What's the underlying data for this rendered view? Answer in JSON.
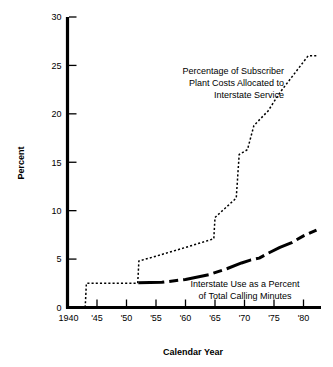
{
  "chart_data": {
    "type": "line",
    "title": "",
    "xlabel": "Calendar Year",
    "ylabel": "Percent",
    "xlim": [
      1940,
      1982.5
    ],
    "ylim": [
      0,
      30
    ],
    "grid": false,
    "legend_position": "inline-annotations",
    "x_tick_labels": [
      "1940",
      "'45",
      "'50",
      "'55",
      "'60",
      "'65",
      "'70",
      "'75",
      "'80"
    ],
    "x_tick_values": [
      1940,
      1945,
      1950,
      1955,
      1960,
      1965,
      1970,
      1975,
      1980
    ],
    "y_tick_labels": [
      "0",
      "5",
      "10",
      "15",
      "20",
      "25",
      "30"
    ],
    "y_tick_values": [
      0,
      5,
      10,
      15,
      20,
      25,
      30
    ],
    "series": [
      {
        "name": "Percentage of Subscriber Plant Costs Allocated to Interstate Service",
        "style": "dotted",
        "color": "#000000",
        "points": [
          [
            1943.0,
            0.0
          ],
          [
            1943.2,
            2.5
          ],
          [
            1951.9,
            2.5
          ],
          [
            1952.1,
            4.8
          ],
          [
            1955.0,
            5.3
          ],
          [
            1960.0,
            6.2
          ],
          [
            1964.8,
            7.1
          ],
          [
            1965.0,
            9.3
          ],
          [
            1968.6,
            11.3
          ],
          [
            1969.1,
            15.8
          ],
          [
            1970.5,
            16.3
          ],
          [
            1971.6,
            18.8
          ],
          [
            1974.0,
            20.3
          ],
          [
            1976.0,
            22.2
          ],
          [
            1980.8,
            26.0
          ],
          [
            1982.2,
            26.0
          ]
        ]
      },
      {
        "name": "Interstate Use as a Percent of Total Calling Minutes",
        "style": "dash-dot-thick",
        "color": "#000000",
        "points": [
          [
            1952.0,
            2.55
          ],
          [
            1956.0,
            2.6
          ],
          [
            1960.0,
            2.9
          ],
          [
            1964.0,
            3.4
          ],
          [
            1967.0,
            4.0
          ],
          [
            1969.5,
            4.6
          ],
          [
            1971.0,
            4.9
          ],
          [
            1972.5,
            5.1
          ],
          [
            1974.0,
            5.6
          ],
          [
            1976.0,
            6.2
          ],
          [
            1978.0,
            6.7
          ],
          [
            1980.0,
            7.4
          ],
          [
            1982.2,
            8.0
          ]
        ]
      }
    ],
    "annotations": [
      {
        "id": "annotation-subscriber-plant",
        "lines": [
          "Percentage of Subscriber",
          "Plant Costs Allocated to",
          "Interstate Service"
        ],
        "align": "right",
        "x_px": 284,
        "y_px": 74
      },
      {
        "id": "annotation-interstate-use",
        "lines": [
          "Interstate Use as a Percent",
          "of Total Calling Minutes"
        ],
        "align": "center",
        "x_px": 245,
        "y_px": 287
      }
    ]
  },
  "axes": {
    "y_title": "Percent",
    "x_title": "Calendar Year"
  }
}
